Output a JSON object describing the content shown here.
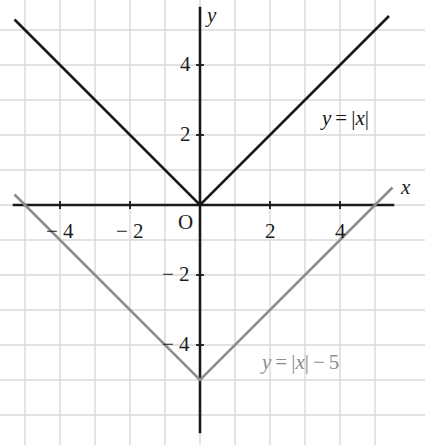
{
  "figure": {
    "width": 425,
    "height": 445,
    "background": "#ffffff"
  },
  "axes": {
    "x_name": "x",
    "y_name": "y",
    "origin_label": "O",
    "origin_px": {
      "x": 200,
      "y": 205
    },
    "unit_px": 35,
    "axis_color": "#1a1a1a",
    "grid_color": "#d8d8d8",
    "x_axis_start_px": 14,
    "x_axis_end_px": 393,
    "y_axis_start_px": 8,
    "y_axis_end_px": 432,
    "x_ticks": [
      {
        "value": -4,
        "label": "− 4"
      },
      {
        "value": -2,
        "label": "− 2"
      },
      {
        "value": 2,
        "label": "2"
      },
      {
        "value": 4,
        "label": "4"
      }
    ],
    "y_ticks": [
      {
        "value": 4,
        "label": "4"
      },
      {
        "value": 2,
        "label": "2"
      },
      {
        "value": -2,
        "label": "− 2"
      },
      {
        "value": -4,
        "label": "− 4"
      }
    ]
  },
  "chart_data": {
    "type": "line",
    "title": "",
    "xlabel": "x",
    "ylabel": "y",
    "xlim": [
      -5.3,
      5.5
    ],
    "ylim": [
      -6.6,
      5.6
    ],
    "grid": true,
    "grid_spacing": 1,
    "legend_position": "inline-annotation",
    "series": [
      {
        "name": "y = |x|",
        "expression": "y = |x|",
        "color": "#161616",
        "vertex": [
          0,
          0
        ],
        "x": [
          -5.3,
          0,
          5.4
        ],
        "values": [
          5.3,
          0,
          5.4
        ],
        "label_parts": {
          "lhs": "y",
          "equals": "=",
          "rhs_bar_open": "|",
          "rhs_var": "x",
          "rhs_bar_close": "|"
        },
        "label_text": "y = |x|",
        "label_px": {
          "x": 322,
          "y": 108
        }
      },
      {
        "name": "y = |x| - 5",
        "expression": "y = |x| − 5",
        "color": "#8d8d8d",
        "vertex": [
          0,
          -5
        ],
        "x": [
          -5.3,
          0,
          5.5
        ],
        "values": [
          0.3,
          -5,
          0.5
        ],
        "x_intercepts": [
          -5,
          5
        ],
        "label_parts": {
          "lhs": "y",
          "equals": "=",
          "rhs_bar_open": "|",
          "rhs_var": "x",
          "rhs_bar_close": "|",
          "minus": "−",
          "constant": "5"
        },
        "label_text": "y = |x| − 5",
        "label_px": {
          "x": 262,
          "y": 352
        }
      }
    ]
  }
}
